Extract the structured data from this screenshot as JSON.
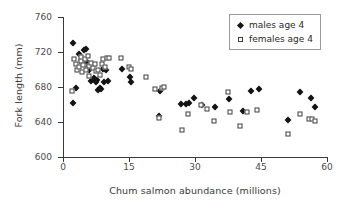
{
  "chart_data": {
    "type": "scatter",
    "title": "",
    "xlabel": "Chum salmon abundance (millions)",
    "ylabel": "Fork length (mm)",
    "xlim": [
      0,
      60
    ],
    "ylim": [
      600,
      760
    ],
    "xticks": [
      0,
      15,
      30,
      45,
      60
    ],
    "yticks": [
      600,
      640,
      680,
      720,
      760
    ],
    "xtick_labels": [
      "0",
      "15",
      "30",
      "45",
      "60"
    ],
    "ytick_labels": [
      "600",
      "640",
      "680",
      "720",
      "760"
    ],
    "grid": false,
    "legend_position": "top-right",
    "marker_colors": {
      "males": "#141414",
      "females": "#ffffff",
      "marker_edge": "#3d3d3d"
    },
    "axis_color": "#3a3a3a",
    "series": [
      {
        "name": "males age 4",
        "marker": "filled-diamond",
        "points": [
          [
            2.2,
            730
          ],
          [
            2.3,
            662
          ],
          [
            3.0,
            679
          ],
          [
            3.6,
            718
          ],
          [
            4.0,
            711
          ],
          [
            4.4,
            707
          ],
          [
            4.8,
            722
          ],
          [
            5.2,
            724
          ],
          [
            5.4,
            709
          ],
          [
            5.6,
            703
          ],
          [
            6.0,
            700
          ],
          [
            6.3,
            687
          ],
          [
            6.6,
            705
          ],
          [
            7.0,
            690
          ],
          [
            7.4,
            686
          ],
          [
            7.8,
            688
          ],
          [
            8.0,
            677
          ],
          [
            8.3,
            679
          ],
          [
            8.6,
            678
          ],
          [
            9.0,
            701
          ],
          [
            9.4,
            686
          ],
          [
            9.8,
            700
          ],
          [
            10.2,
            687
          ],
          [
            13.4,
            701
          ],
          [
            15.2,
            691
          ],
          [
            15.4,
            686
          ],
          [
            21.8,
            647
          ],
          [
            22.0,
            676
          ],
          [
            26.9,
            661
          ],
          [
            28.0,
            661
          ],
          [
            28.6,
            662
          ],
          [
            29.8,
            668
          ],
          [
            31.5,
            660
          ],
          [
            34.5,
            657
          ],
          [
            37.8,
            666
          ],
          [
            40.8,
            653
          ],
          [
            42.8,
            676
          ],
          [
            44.6,
            678
          ],
          [
            51.2,
            642
          ],
          [
            53.8,
            674
          ],
          [
            56.3,
            667
          ],
          [
            57.3,
            657
          ]
        ]
      },
      {
        "name": "females age 4",
        "marker": "open-square",
        "points": [
          [
            2.0,
            676
          ],
          [
            2.6,
            712
          ],
          [
            3.0,
            706
          ],
          [
            3.2,
            700
          ],
          [
            3.6,
            703
          ],
          [
            4.0,
            710
          ],
          [
            4.2,
            714
          ],
          [
            4.4,
            697
          ],
          [
            4.6,
            705
          ],
          [
            5.0,
            712
          ],
          [
            5.2,
            699
          ],
          [
            5.6,
            716
          ],
          [
            5.8,
            704
          ],
          [
            6.0,
            693
          ],
          [
            6.4,
            708
          ],
          [
            6.8,
            702
          ],
          [
            7.2,
            706
          ],
          [
            7.6,
            698
          ],
          [
            8.0,
            700
          ],
          [
            8.4,
            694
          ],
          [
            8.8,
            706
          ],
          [
            9.2,
            712
          ],
          [
            9.6,
            703
          ],
          [
            10.0,
            713
          ],
          [
            10.4,
            713
          ],
          [
            13.2,
            713
          ],
          [
            15.0,
            703
          ],
          [
            15.4,
            701
          ],
          [
            18.8,
            692
          ],
          [
            20.8,
            678
          ],
          [
            21.9,
            645
          ],
          [
            22.6,
            679
          ],
          [
            23.0,
            680
          ],
          [
            27.0,
            631
          ],
          [
            28.4,
            649
          ],
          [
            31.4,
            659
          ],
          [
            32.8,
            655
          ],
          [
            34.4,
            641
          ],
          [
            37.6,
            674
          ],
          [
            38.0,
            651
          ],
          [
            40.2,
            636
          ],
          [
            41.8,
            652
          ],
          [
            44.2,
            654
          ],
          [
            51.2,
            626
          ],
          [
            53.9,
            649
          ],
          [
            56.0,
            644
          ],
          [
            56.6,
            643
          ],
          [
            57.2,
            641
          ]
        ]
      }
    ]
  },
  "legend": {
    "entries": [
      {
        "label": "males age 4",
        "marker": "filled-diamond"
      },
      {
        "label": "females age 4",
        "marker": "open-square"
      }
    ]
  }
}
